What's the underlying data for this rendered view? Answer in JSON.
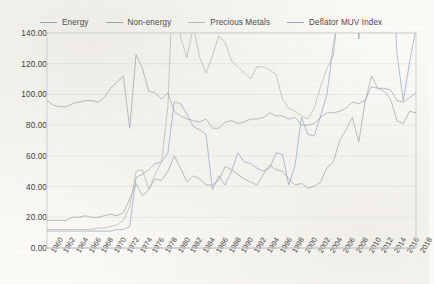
{
  "legend": {
    "position": "top",
    "items": [
      {
        "label": "Energy",
        "color": "#8fa6c4",
        "icon": "line-swatch-icon"
      },
      {
        "label": "Non-energy",
        "color": "#a2a2a2",
        "icon": "line-swatch-icon"
      },
      {
        "label": "Precious Metals",
        "color": "#b0b6a8",
        "icon": "line-swatch-icon"
      },
      {
        "label": "Deflator MUV Index",
        "color": "#9aa3ad",
        "icon": "line-swatch-icon"
      }
    ]
  },
  "axes": {
    "y_ticks": [
      "0.00",
      "20.00",
      "40.00",
      "60.00",
      "80.00",
      "100.00",
      "120.00",
      "140.00"
    ],
    "x_ticks": [
      "1960",
      "1962",
      "1964",
      "1966",
      "1968",
      "1970",
      "1972",
      "1974",
      "1976",
      "1978",
      "1980",
      "1982",
      "1984",
      "1986",
      "1988",
      "1990",
      "1992",
      "1994",
      "1996",
      "1998",
      "2000",
      "2002",
      "2004",
      "2006",
      "2008",
      "2010",
      "2012",
      "2014",
      "2016",
      "2018"
    ]
  },
  "chart_data": {
    "type": "line",
    "title": "",
    "xlabel": "",
    "ylabel": "",
    "ylim": [
      0,
      140
    ],
    "xlim": [
      1960,
      2018
    ],
    "grid": true,
    "legend_position": "top",
    "x": [
      1960,
      1961,
      1962,
      1963,
      1964,
      1965,
      1966,
      1967,
      1968,
      1969,
      1970,
      1971,
      1972,
      1973,
      1974,
      1975,
      1976,
      1977,
      1978,
      1979,
      1980,
      1981,
      1982,
      1983,
      1984,
      1985,
      1986,
      1987,
      1988,
      1989,
      1990,
      1991,
      1992,
      1993,
      1994,
      1995,
      1996,
      1997,
      1998,
      1999,
      2000,
      2001,
      2002,
      2003,
      2004,
      2005,
      2006,
      2007,
      2008,
      2009,
      2010,
      2011,
      2012,
      2013,
      2014,
      2015,
      2016,
      2017,
      2018
    ],
    "series": [
      {
        "name": "Energy",
        "color": "#8fa6c4",
        "values": [
          11,
          11,
          11,
          11,
          11,
          11,
          11,
          11,
          11,
          11,
          11,
          12,
          12,
          14,
          46,
          48,
          51,
          55,
          56,
          62,
          95,
          94,
          87,
          79,
          77,
          74,
          38,
          47,
          41,
          50,
          62,
          56,
          55,
          52,
          50,
          52,
          62,
          61,
          41,
          54,
          85,
          74,
          73,
          86,
          100,
          132,
          155,
          168,
          228,
          136,
          172,
          222,
          222,
          221,
          211,
          127,
          96,
          121,
          143
        ]
      },
      {
        "name": "Non-energy",
        "color": "#a2a2a2",
        "values": [
          18,
          18,
          18,
          18,
          20,
          20,
          21,
          20,
          20,
          21,
          22,
          21,
          23,
          32,
          42,
          34,
          38,
          45,
          44,
          50,
          60,
          52,
          43,
          47,
          45,
          41,
          41,
          44,
          53,
          51,
          48,
          45,
          43,
          41,
          48,
          54,
          51,
          50,
          45,
          41,
          42,
          39,
          40,
          43,
          52,
          56,
          70,
          77,
          85,
          69,
          95,
          112,
          104,
          102,
          97,
          83,
          81,
          89,
          88
        ]
      },
      {
        "name": "Precious Metals",
        "color": "#b0b6a8",
        "values": [
          12,
          12,
          12,
          12,
          12,
          12,
          12,
          12,
          13,
          13,
          14,
          15,
          18,
          27,
          50,
          51,
          38,
          48,
          56,
          92,
          194,
          137,
          124,
          144,
          124,
          114,
          125,
          138,
          134,
          122,
          118,
          114,
          110,
          118,
          118,
          116,
          113,
          97,
          91,
          89,
          86,
          84,
          91,
          105,
          117,
          125,
          163,
          189,
          211,
          216,
          281,
          385,
          414,
          348,
          292,
          254,
          260,
          270,
          272
        ]
      },
      {
        "name": "Deflator MUV Index",
        "color": "#9aa3ad",
        "values": [
          96,
          93,
          92,
          92,
          94,
          95,
          96,
          96,
          95,
          98,
          104,
          108,
          112,
          78,
          126,
          117,
          102,
          101,
          97,
          101,
          89,
          86,
          84,
          83,
          82,
          84,
          78,
          78,
          82,
          83,
          81,
          82,
          84,
          84,
          85,
          88,
          86,
          86,
          84,
          85,
          80,
          80,
          81,
          85,
          88,
          88,
          89,
          91,
          95,
          94,
          96,
          105,
          104,
          104,
          103,
          96,
          95,
          98,
          101
        ]
      }
    ],
    "note": "Energy, Non-energy and Precious Metals series are rendered clipped to the 0-140 axis range; values above 140 run off the top of the plot frame."
  }
}
